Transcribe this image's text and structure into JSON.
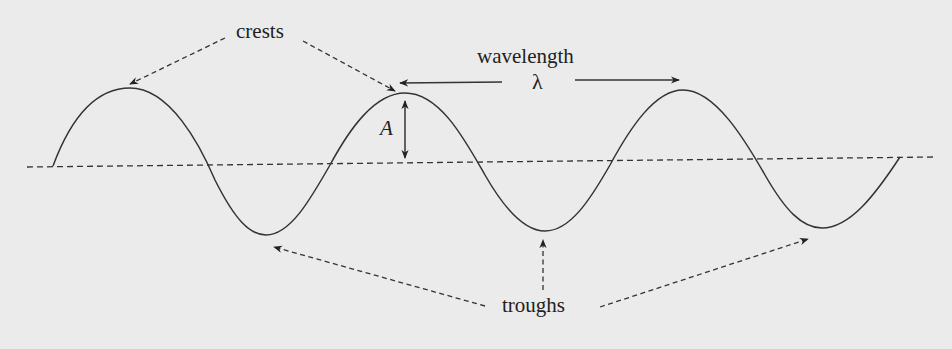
{
  "diagram": {
    "labels": {
      "crests": "crests",
      "wavelength": "wavelength",
      "lambda": "λ",
      "amplitude": "A",
      "troughs": "troughs"
    },
    "colors": {
      "background": "#ebebeb",
      "ink": "#222222",
      "wave": "#333333"
    },
    "wave": {
      "cycles": 3.25,
      "crests": [
        [
          130,
          88
        ],
        [
          405,
          93
        ],
        [
          683,
          90
        ]
      ],
      "troughs": [
        [
          266,
          235
        ],
        [
          545,
          231
        ],
        [
          822,
          228
        ]
      ],
      "start": [
        53,
        166
      ],
      "end": [
        900,
        157
      ]
    },
    "equilibrium_line": {
      "from": [
        27,
        167
      ],
      "to": [
        935,
        157
      ],
      "style": "dashed"
    }
  }
}
